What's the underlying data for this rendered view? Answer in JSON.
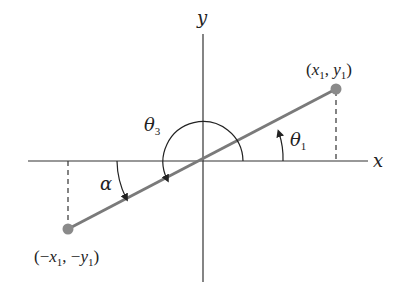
{
  "diagram": {
    "type": "coordinate-angle-diagram",
    "axes": {
      "x_label": "x",
      "y_label": "y"
    },
    "points": [
      {
        "id": "p1",
        "label": "(x₁, y₁)",
        "label_parts": [
          "(",
          "x",
          "1",
          ", ",
          "y",
          "1",
          ")"
        ]
      },
      {
        "id": "p2",
        "label": "(−x₁, −y₁)",
        "label_parts": [
          "(−",
          "x",
          "1",
          ", −",
          "y",
          "1",
          ")"
        ]
      }
    ],
    "angles": [
      {
        "id": "theta1",
        "symbol": "θ",
        "subscript": "1",
        "description": "counterclockwise from positive x-axis to segment"
      },
      {
        "id": "theta3",
        "symbol": "θ",
        "subscript": "3",
        "description": "counterclockwise from positive x-axis to opposite ray"
      },
      {
        "id": "alpha",
        "symbol": "α",
        "description": "clockwise from negative x-axis to opposite ray"
      }
    ],
    "colors": {
      "axes": "#333333",
      "segment": "#7a7a7a",
      "points": "#8a8a8a",
      "text": "#222222"
    }
  }
}
